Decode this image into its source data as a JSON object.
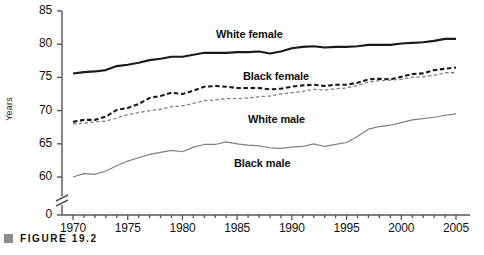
{
  "figure": {
    "caption_label": "FIGURE 19.2",
    "bullet_icon": "square-bullet-icon"
  },
  "chart_data": {
    "type": "line",
    "title": "",
    "xlabel": "",
    "ylabel": "Years",
    "xlim": [
      1970,
      2005
    ],
    "ylim": [
      55,
      85
    ],
    "grid": false,
    "axis_break": true,
    "axis_break_note": "y-axis broken between 0 and 55",
    "legend_position": "inline-annotations",
    "y_ticks": [
      "0",
      "60",
      "65",
      "70",
      "75",
      "80",
      "85"
    ],
    "x_ticks": [
      "1970",
      "1975",
      "1980",
      "1985",
      "1990",
      "1995",
      "2000",
      "2005"
    ],
    "x": [
      1970,
      1971,
      1972,
      1973,
      1974,
      1975,
      1976,
      1977,
      1978,
      1979,
      1980,
      1981,
      1982,
      1983,
      1984,
      1985,
      1986,
      1987,
      1988,
      1989,
      1990,
      1991,
      1992,
      1993,
      1994,
      1995,
      1996,
      1997,
      1998,
      1999,
      2000,
      2001,
      2002,
      2003,
      2004,
      2005
    ],
    "series": [
      {
        "name": "White female",
        "label": "White female",
        "style": "solid-thick",
        "color": "#1a1a1a",
        "values": [
          75.6,
          75.8,
          75.9,
          76.1,
          76.7,
          76.9,
          77.2,
          77.6,
          77.8,
          78.1,
          78.1,
          78.4,
          78.7,
          78.7,
          78.7,
          78.8,
          78.8,
          78.9,
          78.6,
          78.9,
          79.4,
          79.6,
          79.7,
          79.5,
          79.6,
          79.6,
          79.7,
          79.9,
          79.9,
          79.9,
          80.1,
          80.2,
          80.3,
          80.5,
          80.8,
          80.8
        ]
      },
      {
        "name": "Black female",
        "label": "Black female",
        "style": "dashed-thick",
        "color": "#1a1a1a",
        "values": [
          68.3,
          68.6,
          68.6,
          69.1,
          70.1,
          70.4,
          71.0,
          71.9,
          72.2,
          72.7,
          72.5,
          73.0,
          73.6,
          73.7,
          73.6,
          73.4,
          73.4,
          73.4,
          73.2,
          73.3,
          73.6,
          73.8,
          73.9,
          73.7,
          73.9,
          73.9,
          74.2,
          74.7,
          74.8,
          74.7,
          75.1,
          75.5,
          75.6,
          76.1,
          76.3,
          76.5
        ]
      },
      {
        "name": "White male",
        "label": "White male",
        "style": "dashed-thin",
        "color": "#808080",
        "values": [
          68.0,
          68.1,
          68.3,
          68.4,
          68.9,
          69.4,
          69.7,
          70.0,
          70.2,
          70.6,
          70.7,
          71.1,
          71.5,
          71.6,
          71.8,
          71.8,
          71.9,
          72.1,
          72.2,
          72.5,
          72.7,
          72.9,
          73.2,
          73.1,
          73.3,
          73.4,
          73.8,
          74.3,
          74.5,
          74.6,
          74.7,
          75.0,
          75.1,
          75.3,
          75.7,
          75.7
        ]
      },
      {
        "name": "Black male",
        "label": "Black male",
        "style": "solid-thin",
        "color": "#808080",
        "values": [
          60.0,
          60.5,
          60.4,
          60.9,
          61.7,
          62.4,
          62.9,
          63.4,
          63.7,
          64.0,
          63.8,
          64.5,
          64.9,
          64.9,
          65.3,
          65.0,
          64.8,
          64.7,
          64.4,
          64.3,
          64.5,
          64.6,
          65.0,
          64.6,
          64.9,
          65.2,
          66.1,
          67.2,
          67.6,
          67.8,
          68.2,
          68.6,
          68.8,
          69.0,
          69.3,
          69.5
        ]
      }
    ]
  }
}
